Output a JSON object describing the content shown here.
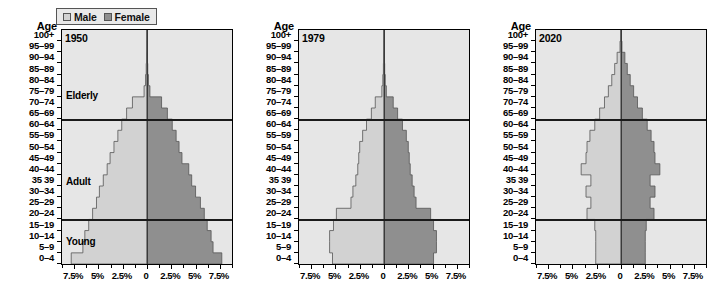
{
  "legend": {
    "male_label": "Male",
    "female_label": "Female",
    "male_color": "#d2d2d2",
    "female_color": "#8f8f8f"
  },
  "axis": {
    "age_header": "Age",
    "age_labels": [
      "100+",
      "95–99",
      "90–94",
      "85–89",
      "80–84",
      "75–79",
      "70–74",
      "65–69",
      "60–64",
      "55–59",
      "50–54",
      "45–49",
      "40–44",
      "35 39",
      "30–34",
      "25–29",
      "20–24",
      "15–19",
      "10–14",
      "5–9",
      "0–4"
    ],
    "x_tick_labels": [
      "7.5%",
      "5%",
      "2.5%",
      "0",
      "2.5%",
      "5%",
      "7.5%"
    ],
    "x_tick_values": [
      -7.5,
      -5,
      -2.5,
      0,
      2.5,
      5,
      7.5
    ],
    "xlim": [
      -8.75,
      8.75
    ]
  },
  "segments": {
    "elderly": "Elderly",
    "adult": "Adult",
    "young": "Young"
  },
  "chart_data": {
    "type": "area",
    "title": "",
    "xlabel": "",
    "ylabel": "Age",
    "xlim": [
      -8.75,
      8.75
    ],
    "grid": false,
    "legend_position": "top-left",
    "categories": [
      "0–4",
      "5–9",
      "10–14",
      "15–19",
      "20–24",
      "25–29",
      "30–34",
      "35 39",
      "40–44",
      "45–49",
      "50–54",
      "55–59",
      "60–64",
      "65–69",
      "70–74",
      "75–79",
      "80–84",
      "85–89",
      "90–94",
      "95–99",
      "100+"
    ],
    "panels": [
      {
        "year": "1950",
        "male": [
          7.8,
          6.6,
          6.4,
          6.0,
          5.6,
          5.2,
          4.9,
          4.5,
          4.1,
          3.8,
          3.4,
          3.0,
          2.6,
          2.1,
          1.5,
          0.3,
          0.15,
          0.08,
          0.04,
          0.02,
          0.0
        ],
        "female": [
          7.7,
          6.8,
          6.6,
          6.2,
          5.9,
          5.5,
          5.0,
          4.6,
          4.3,
          3.6,
          3.3,
          3.0,
          2.6,
          2.1,
          1.5,
          0.3,
          0.15,
          0.08,
          0.04,
          0.02,
          0.0
        ]
      },
      {
        "year": "1979",
        "male": [
          5.3,
          5.6,
          5.6,
          5.2,
          4.9,
          3.4,
          3.2,
          2.9,
          2.7,
          2.6,
          2.5,
          2.2,
          1.8,
          1.3,
          0.9,
          0.22,
          0.12,
          0.06,
          0.03,
          0.015,
          0.0
        ],
        "female": [
          5.1,
          5.4,
          5.4,
          5.1,
          4.8,
          3.3,
          3.1,
          2.9,
          2.7,
          2.6,
          2.5,
          2.3,
          1.9,
          1.4,
          0.95,
          0.24,
          0.13,
          0.07,
          0.03,
          0.015,
          0.0
        ]
      },
      {
        "year": "2020",
        "male": [
          2.6,
          2.6,
          2.6,
          2.7,
          3.5,
          3.1,
          3.6,
          3.1,
          4.1,
          3.6,
          3.5,
          3.2,
          2.7,
          2.2,
          1.7,
          1.3,
          0.95,
          0.65,
          0.4,
          0.1,
          0.0
        ],
        "female": [
          2.5,
          2.5,
          2.5,
          2.6,
          3.4,
          3.0,
          3.5,
          3.0,
          4.0,
          3.5,
          3.4,
          3.1,
          2.7,
          2.2,
          1.7,
          1.3,
          0.95,
          0.65,
          0.4,
          0.1,
          0.0
        ]
      }
    ]
  }
}
